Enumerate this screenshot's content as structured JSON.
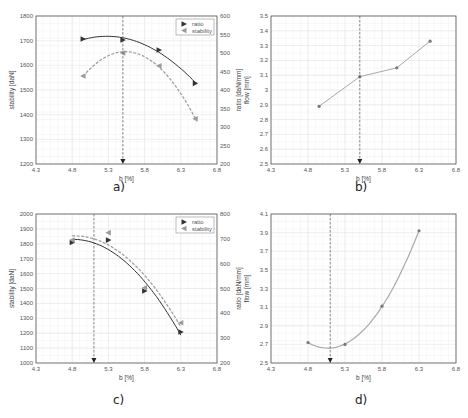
{
  "colors": {
    "ratio": "#333333",
    "stability": "#9a9a9a",
    "flow": "#a8a8a8",
    "grid": "#e6e6e6",
    "frame": "#555555",
    "dashed": "#555555"
  },
  "captions": {
    "a": "a)",
    "b": "b)",
    "c": "c)",
    "d": "d)"
  },
  "chart_data": [
    {
      "id": "a",
      "type": "scatter",
      "title": "",
      "xlabel": "b [%]",
      "ylabel": "stability [daN]",
      "ylabel_right": "ratio [daN/mm]",
      "xlim": [
        4.3,
        6.8
      ],
      "ylim": [
        1200,
        1800
      ],
      "ylim_right": [
        200,
        600
      ],
      "xticks": [
        4.3,
        4.8,
        5.3,
        5.8,
        6.3,
        6.8
      ],
      "yticks": [
        1200,
        1300,
        1400,
        1500,
        1600,
        1700,
        1800
      ],
      "yticks_right": [
        200,
        250,
        300,
        350,
        400,
        450,
        500,
        550,
        600
      ],
      "grid": true,
      "legend": {
        "position": "upper right",
        "entries": [
          "ratio",
          "stability"
        ]
      },
      "optimum_line_x": 5.5,
      "series": [
        {
          "name": "ratio",
          "axis": "right",
          "marker": "triangle-right",
          "fit": "quadratic",
          "x": [
            4.95,
            5.5,
            6.0,
            6.5
          ],
          "values": [
            538,
            535,
            508,
            418
          ]
        },
        {
          "name": "stability",
          "axis": "left",
          "marker": "triangle-left",
          "fit": "quadratic-dashed",
          "x": [
            4.95,
            5.5,
            6.0,
            6.5
          ],
          "values": [
            1557,
            1650,
            1598,
            1383
          ]
        }
      ]
    },
    {
      "id": "b",
      "type": "line",
      "title": "",
      "xlabel": "b [%]",
      "ylabel": "flow [mm]",
      "xlim": [
        4.3,
        6.8
      ],
      "ylim": [
        2.5,
        3.5
      ],
      "xticks": [
        4.3,
        4.8,
        5.3,
        5.8,
        6.3,
        6.8
      ],
      "yticks": [
        2.5,
        2.6,
        2.7,
        2.8,
        2.9,
        3,
        3.1,
        3.2,
        3.3,
        3.4,
        3.5
      ],
      "grid": true,
      "optimum_line_x": 5.5,
      "series": [
        {
          "name": "flow",
          "marker": "dot",
          "x": [
            4.95,
            5.5,
            6.0,
            6.45
          ],
          "values": [
            2.89,
            3.09,
            3.15,
            3.33
          ]
        }
      ]
    },
    {
      "id": "c",
      "type": "scatter",
      "title": "",
      "xlabel": "b [%]",
      "ylabel": "stability [daN]",
      "ylabel_right": "ratio [daN/mm]",
      "xlim": [
        4.3,
        6.8
      ],
      "ylim": [
        1000,
        2000
      ],
      "ylim_right": [
        200,
        800
      ],
      "xticks": [
        4.3,
        4.8,
        5.3,
        5.8,
        6.3,
        6.8
      ],
      "yticks": [
        1000,
        1100,
        1200,
        1300,
        1400,
        1500,
        1600,
        1700,
        1800,
        1900,
        2000
      ],
      "yticks_right": [
        200,
        300,
        400,
        500,
        600,
        700,
        800
      ],
      "grid": true,
      "legend": {
        "position": "upper right",
        "entries": [
          "ratio",
          "stability"
        ]
      },
      "optimum_line_x": 5.1,
      "series": [
        {
          "name": "ratio",
          "axis": "right",
          "marker": "triangle-right",
          "fit": "quadratic",
          "x": [
            4.8,
            5.3,
            5.8,
            6.3
          ],
          "values": [
            685,
            695,
            490,
            325
          ]
        },
        {
          "name": "stability",
          "axis": "left",
          "marker": "triangle-left",
          "fit": "quadratic-dashed",
          "x": [
            4.8,
            5.3,
            5.8,
            6.3
          ],
          "values": [
            1825,
            1875,
            1505,
            1270
          ]
        }
      ]
    },
    {
      "id": "d",
      "type": "line",
      "title": "",
      "xlabel": "b [%]",
      "ylabel": "flow [mm]",
      "xlim": [
        4.3,
        6.8
      ],
      "ylim": [
        2.5,
        4.1
      ],
      "xticks": [
        4.3,
        4.8,
        5.3,
        5.8,
        6.3,
        6.8
      ],
      "yticks": [
        2.5,
        2.7,
        2.9,
        3.1,
        3.3,
        3.5,
        3.7,
        3.9,
        4.1
      ],
      "grid": true,
      "optimum_line_x": 5.1,
      "series": [
        {
          "name": "flow",
          "marker": "dot",
          "fit": "quadratic",
          "x": [
            4.8,
            5.3,
            5.8,
            6.3
          ],
          "values": [
            2.72,
            2.7,
            3.11,
            3.92
          ]
        }
      ]
    }
  ]
}
